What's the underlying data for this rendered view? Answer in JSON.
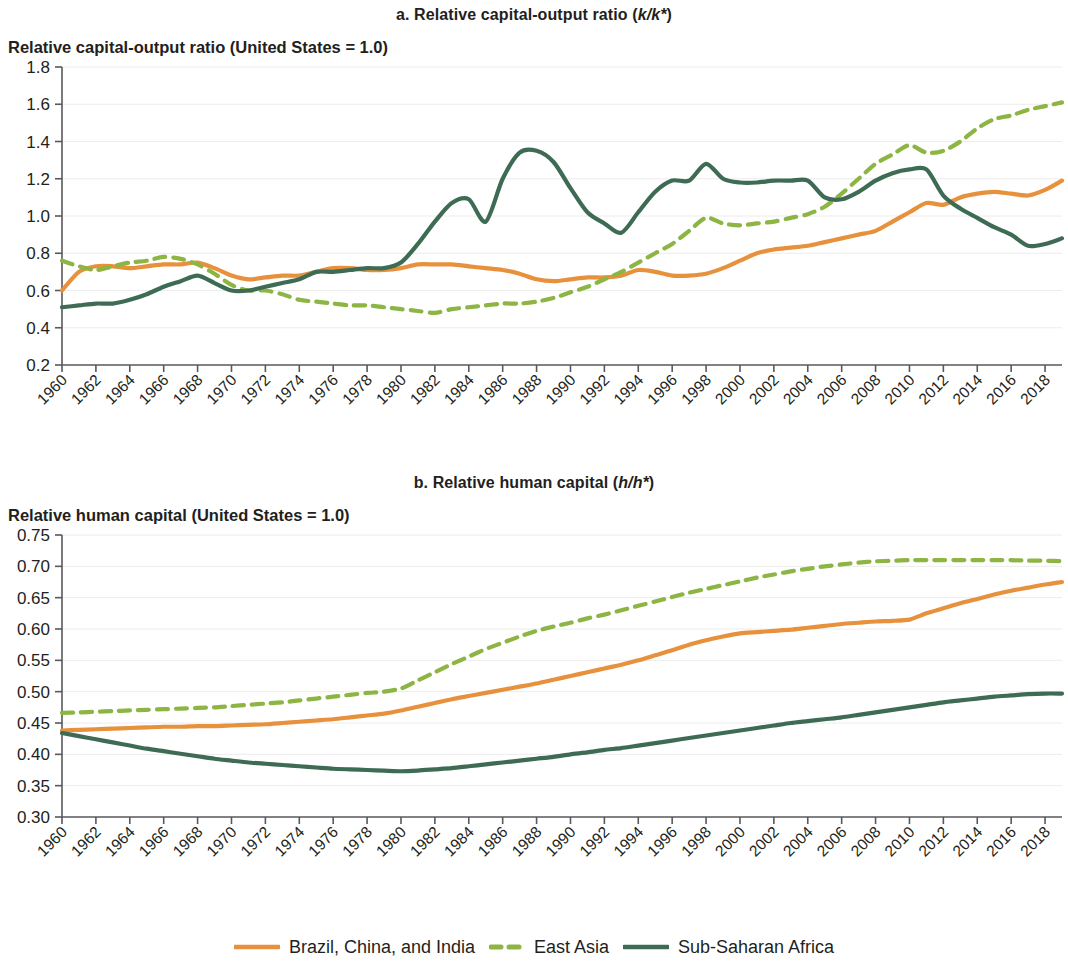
{
  "figure": {
    "panel_a": {
      "title_prefix": "a. Relative capital-output ratio (",
      "title_italic": "k/k*",
      "title_suffix": ")",
      "axis_caption": "Relative capital-output ratio (United States = 1.0)"
    },
    "panel_b": {
      "title_prefix": "b. Relative human capital (",
      "title_italic": "h/h*",
      "title_suffix": ")",
      "axis_caption": "Relative human capital (United States = 1.0)"
    },
    "legend": {
      "items": [
        {
          "label": "Brazil, China, and India",
          "color": "#E8913C",
          "style": "solid"
        },
        {
          "label": "East Asia",
          "color": "#8CB544",
          "style": "dashed"
        },
        {
          "label": "Sub-Saharan Africa",
          "color": "#3E6B53",
          "style": "solid"
        }
      ]
    }
  },
  "chart_data": [
    {
      "type": "line",
      "title": "a. Relative capital-output ratio (k/k*)",
      "subtitle": "Relative capital-output ratio (United States = 1.0)",
      "xlabel": "",
      "ylabel": "Relative capital-output ratio (United States = 1.0)",
      "xlim": [
        1960,
        2019
      ],
      "ylim": [
        0.2,
        1.8
      ],
      "ytick_step": 0.2,
      "yticks": [
        0.2,
        0.4,
        0.6,
        0.8,
        1.0,
        1.2,
        1.4,
        1.6,
        1.8
      ],
      "ytick_labels": [
        "0.2",
        "0.4",
        "0.6",
        "0.8",
        "1.0",
        "1.2",
        "1.4",
        "1.6",
        "1.8"
      ],
      "x": [
        1960,
        1961,
        1962,
        1963,
        1964,
        1965,
        1966,
        1967,
        1968,
        1969,
        1970,
        1971,
        1972,
        1973,
        1974,
        1975,
        1976,
        1977,
        1978,
        1979,
        1980,
        1981,
        1982,
        1983,
        1984,
        1985,
        1986,
        1987,
        1988,
        1989,
        1990,
        1991,
        1992,
        1993,
        1994,
        1995,
        1996,
        1997,
        1998,
        1999,
        2000,
        2001,
        2002,
        2003,
        2004,
        2005,
        2006,
        2007,
        2008,
        2009,
        2010,
        2011,
        2012,
        2013,
        2014,
        2015,
        2016,
        2017,
        2018,
        2019
      ],
      "xtick_labels": [
        "1960",
        "1962",
        "1964",
        "1966",
        "1968",
        "1970",
        "1972",
        "1974",
        "1976",
        "1978",
        "1980",
        "1982",
        "1984",
        "1986",
        "1988",
        "1990",
        "1992",
        "1994",
        "1996",
        "1998",
        "2000",
        "2002",
        "2004",
        "2006",
        "2008",
        "2010",
        "2012",
        "2014",
        "2016",
        "2018"
      ],
      "grid": true,
      "legend_position": "bottom",
      "series": [
        {
          "name": "Brazil, China, and India",
          "color": "#E8913C",
          "style": "solid",
          "values": [
            0.6,
            0.7,
            0.73,
            0.73,
            0.72,
            0.73,
            0.74,
            0.74,
            0.75,
            0.72,
            0.68,
            0.66,
            0.67,
            0.68,
            0.68,
            0.7,
            0.72,
            0.72,
            0.71,
            0.71,
            0.72,
            0.74,
            0.74,
            0.74,
            0.73,
            0.72,
            0.71,
            0.69,
            0.66,
            0.65,
            0.66,
            0.67,
            0.67,
            0.68,
            0.71,
            0.7,
            0.68,
            0.68,
            0.69,
            0.72,
            0.76,
            0.8,
            0.82,
            0.83,
            0.84,
            0.86,
            0.88,
            0.9,
            0.92,
            0.97,
            1.02,
            1.07,
            1.06,
            1.1,
            1.12,
            1.13,
            1.12,
            1.11,
            1.14,
            1.19
          ]
        },
        {
          "name": "East Asia",
          "color": "#8CB544",
          "style": "dashed",
          "values": [
            0.76,
            0.73,
            0.71,
            0.73,
            0.75,
            0.76,
            0.78,
            0.77,
            0.74,
            0.69,
            0.63,
            0.6,
            0.6,
            0.58,
            0.55,
            0.54,
            0.53,
            0.52,
            0.52,
            0.51,
            0.5,
            0.49,
            0.48,
            0.5,
            0.51,
            0.52,
            0.53,
            0.53,
            0.54,
            0.56,
            0.59,
            0.62,
            0.66,
            0.7,
            0.75,
            0.8,
            0.85,
            0.92,
            0.99,
            0.96,
            0.95,
            0.96,
            0.97,
            0.99,
            1.01,
            1.05,
            1.12,
            1.2,
            1.28,
            1.33,
            1.38,
            1.34,
            1.35,
            1.4,
            1.47,
            1.52,
            1.54,
            1.57,
            1.59,
            1.61
          ]
        },
        {
          "name": "Sub-Saharan Africa",
          "color": "#3E6B53",
          "style": "solid",
          "values": [
            0.51,
            0.52,
            0.53,
            0.53,
            0.55,
            0.58,
            0.62,
            0.65,
            0.68,
            0.64,
            0.6,
            0.6,
            0.62,
            0.64,
            0.66,
            0.7,
            0.7,
            0.71,
            0.72,
            0.72,
            0.75,
            0.85,
            0.97,
            1.07,
            1.09,
            0.97,
            1.2,
            1.34,
            1.35,
            1.29,
            1.15,
            1.02,
            0.96,
            0.91,
            1.02,
            1.13,
            1.19,
            1.19,
            1.28,
            1.2,
            1.18,
            1.18,
            1.19,
            1.19,
            1.19,
            1.1,
            1.09,
            1.13,
            1.19,
            1.23,
            1.25,
            1.25,
            1.11,
            1.04,
            0.99,
            0.94,
            0.9,
            0.84,
            0.85,
            0.88
          ]
        }
      ]
    },
    {
      "type": "line",
      "title": "b. Relative human capital (h/h*)",
      "subtitle": "Relative human capital (United States = 1.0)",
      "xlabel": "",
      "ylabel": "Relative human capital (United States = 1.0)",
      "xlim": [
        1960,
        2019
      ],
      "ylim": [
        0.3,
        0.75
      ],
      "ytick_step": 0.05,
      "yticks": [
        0.3,
        0.35,
        0.4,
        0.45,
        0.5,
        0.55,
        0.6,
        0.65,
        0.7,
        0.75
      ],
      "ytick_labels": [
        "0.30",
        "0.35",
        "0.40",
        "0.45",
        "0.50",
        "0.55",
        "0.60",
        "0.65",
        "0.70",
        "0.75"
      ],
      "x": [
        1960,
        1961,
        1962,
        1963,
        1964,
        1965,
        1966,
        1967,
        1968,
        1969,
        1970,
        1971,
        1972,
        1973,
        1974,
        1975,
        1976,
        1977,
        1978,
        1979,
        1980,
        1981,
        1982,
        1983,
        1984,
        1985,
        1986,
        1987,
        1988,
        1989,
        1990,
        1991,
        1992,
        1993,
        1994,
        1995,
        1996,
        1997,
        1998,
        1999,
        2000,
        2001,
        2002,
        2003,
        2004,
        2005,
        2006,
        2007,
        2008,
        2009,
        2010,
        2011,
        2012,
        2013,
        2014,
        2015,
        2016,
        2017,
        2018,
        2019
      ],
      "xtick_labels": [
        "1960",
        "1962",
        "1964",
        "1966",
        "1968",
        "1970",
        "1972",
        "1974",
        "1976",
        "1978",
        "1980",
        "1982",
        "1984",
        "1986",
        "1988",
        "1990",
        "1992",
        "1994",
        "1996",
        "1998",
        "2000",
        "2002",
        "2004",
        "2006",
        "2008",
        "2010",
        "2012",
        "2014",
        "2016",
        "2018"
      ],
      "grid": true,
      "legend_position": "bottom",
      "series": [
        {
          "name": "Brazil, China, and India",
          "color": "#E8913C",
          "style": "solid",
          "values": [
            0.438,
            0.439,
            0.44,
            0.441,
            0.442,
            0.443,
            0.444,
            0.444,
            0.445,
            0.445,
            0.446,
            0.447,
            0.448,
            0.45,
            0.452,
            0.454,
            0.456,
            0.459,
            0.462,
            0.465,
            0.47,
            0.476,
            0.482,
            0.488,
            0.493,
            0.498,
            0.503,
            0.508,
            0.513,
            0.519,
            0.525,
            0.531,
            0.537,
            0.543,
            0.55,
            0.558,
            0.566,
            0.575,
            0.582,
            0.588,
            0.593,
            0.595,
            0.597,
            0.599,
            0.602,
            0.605,
            0.608,
            0.61,
            0.612,
            0.613,
            0.615,
            0.625,
            0.633,
            0.641,
            0.648,
            0.655,
            0.661,
            0.666,
            0.671,
            0.675
          ]
        },
        {
          "name": "East Asia",
          "color": "#8CB544",
          "style": "dashed",
          "values": [
            0.466,
            0.467,
            0.468,
            0.469,
            0.47,
            0.471,
            0.472,
            0.473,
            0.474,
            0.475,
            0.477,
            0.479,
            0.481,
            0.483,
            0.486,
            0.489,
            0.492,
            0.495,
            0.498,
            0.5,
            0.505,
            0.518,
            0.531,
            0.544,
            0.556,
            0.568,
            0.578,
            0.588,
            0.597,
            0.604,
            0.61,
            0.617,
            0.623,
            0.63,
            0.637,
            0.644,
            0.651,
            0.658,
            0.664,
            0.67,
            0.676,
            0.682,
            0.687,
            0.692,
            0.696,
            0.7,
            0.703,
            0.706,
            0.708,
            0.709,
            0.71,
            0.71,
            0.71,
            0.71,
            0.71,
            0.71,
            0.71,
            0.709,
            0.709,
            0.708
          ]
        },
        {
          "name": "Sub-Saharan Africa",
          "color": "#3E6B53",
          "style": "solid",
          "values": [
            0.434,
            0.429,
            0.424,
            0.419,
            0.414,
            0.409,
            0.405,
            0.401,
            0.397,
            0.393,
            0.39,
            0.387,
            0.385,
            0.383,
            0.381,
            0.379,
            0.377,
            0.376,
            0.375,
            0.374,
            0.373,
            0.374,
            0.376,
            0.378,
            0.381,
            0.384,
            0.387,
            0.39,
            0.393,
            0.396,
            0.4,
            0.403,
            0.407,
            0.41,
            0.414,
            0.418,
            0.422,
            0.426,
            0.43,
            0.434,
            0.438,
            0.442,
            0.446,
            0.45,
            0.453,
            0.456,
            0.459,
            0.463,
            0.467,
            0.471,
            0.475,
            0.479,
            0.483,
            0.486,
            0.489,
            0.492,
            0.494,
            0.496,
            0.497,
            0.497
          ]
        }
      ]
    }
  ]
}
